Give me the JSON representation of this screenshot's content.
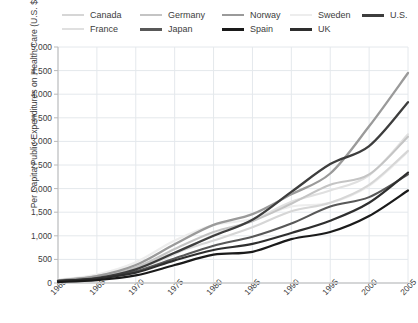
{
  "chart_data": {
    "type": "line",
    "title": "",
    "xlabel": "",
    "ylabel": "Per Capita Public Expenditures on Health Care (U.S. $ PPP)",
    "xlim": [
      1960,
      2005
    ],
    "ylim": [
      0,
      5000
    ],
    "grid": true,
    "legend_position": "top",
    "y_ticks": [
      "0",
      "500",
      "1,000",
      "1,500",
      "2,000",
      "2,500",
      "3,000",
      "3,500",
      "4,000",
      "4,500",
      "5,000"
    ],
    "y_tick_values": [
      0,
      500,
      1000,
      1500,
      2000,
      2500,
      3000,
      3500,
      4000,
      4500,
      5000
    ],
    "x_ticks": [
      "1960",
      "1965",
      "1970",
      "1975",
      "1980",
      "1985",
      "1990",
      "1995",
      "2000",
      "2005"
    ],
    "x_tick_values": [
      1960,
      1965,
      1970,
      1975,
      1980,
      1985,
      1990,
      1995,
      2000,
      2005
    ],
    "x": [
      1960,
      1965,
      1970,
      1975,
      1980,
      1985,
      1990,
      1995,
      2000,
      2005
    ],
    "series": [
      {
        "name": "Canada",
        "color": "#d6d6d6",
        "width": 2.1,
        "values": [
          55,
          130,
          330,
          640,
          900,
          1180,
          1520,
          1700,
          2080,
          2800
        ]
      },
      {
        "name": "France",
        "color": "#e0e0e0",
        "width": 2.1,
        "values": [
          45,
          120,
          290,
          610,
          1020,
          1320,
          1720,
          1960,
          2280,
          3150
        ]
      },
      {
        "name": "Germany",
        "color": "#c4c4c4",
        "width": 2.1,
        "values": [
          60,
          150,
          330,
          720,
          1080,
          1310,
          1680,
          2080,
          2300,
          3100
        ]
      },
      {
        "name": "Japan",
        "color": "#585858",
        "width": 2.1,
        "values": [
          30,
          95,
          250,
          520,
          790,
          980,
          1260,
          1620,
          1820,
          2300
        ]
      },
      {
        "name": "Norway",
        "color": "#9a9a9a",
        "width": 2.3,
        "values": [
          50,
          145,
          380,
          820,
          1230,
          1460,
          1880,
          2320,
          3320,
          4450
        ]
      },
      {
        "name": "Spain",
        "color": "#1a1a1a",
        "width": 2.2,
        "values": [
          20,
          60,
          160,
          380,
          600,
          660,
          930,
          1080,
          1420,
          1960
        ]
      },
      {
        "name": "Sweden",
        "color": "#ededed",
        "width": 2.1,
        "values": [
          70,
          180,
          440,
          900,
          1230,
          1350,
          1620,
          1700,
          2060,
          2780
        ]
      },
      {
        "name": "U.K.",
        "color": "#2e2e2e",
        "width": 2.2,
        "values": [
          40,
          95,
          220,
          480,
          700,
          830,
          1060,
          1320,
          1700,
          2340
        ]
      },
      {
        "name": "U.S.",
        "color": "#3d3d3d",
        "width": 2.3,
        "values": [
          45,
          105,
          290,
          640,
          1000,
          1340,
          1930,
          2520,
          2900,
          3830
        ]
      }
    ]
  },
  "legend": {
    "items": [
      {
        "label": "Canada",
        "color": "#d6d6d6",
        "width": 2.1
      },
      {
        "label": "Germany",
        "color": "#c4c4c4",
        "width": 2.1
      },
      {
        "label": "Norway",
        "color": "#9a9a9a",
        "width": 2.3
      },
      {
        "label": "Sweden",
        "color": "#ededed",
        "width": 2.1
      },
      {
        "label": "U.S.",
        "color": "#3d3d3d",
        "width": 3.0
      },
      {
        "label": "France",
        "color": "#e0e0e0",
        "width": 2.1
      },
      {
        "label": "Japan",
        "color": "#585858",
        "width": 3.0
      },
      {
        "label": "Spain",
        "color": "#1a1a1a",
        "width": 3.0
      },
      {
        "label": "UK",
        "color": "#2e2e2e",
        "width": 3.0
      }
    ]
  },
  "axes": {
    "y_title": "Per Capita Public Expenditures on Health Care (U.S. $ PPP)"
  },
  "style": {
    "grid_color": "#e4e8ec",
    "axis_color": "#b9b9b9",
    "text_color": "#3d3d3d",
    "background": "#ffffff"
  }
}
